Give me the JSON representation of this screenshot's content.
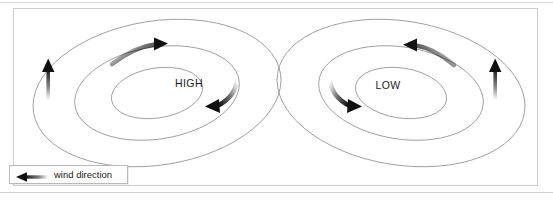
{
  "diagram": {
    "type": "meteorological-pressure-systems",
    "systems": [
      {
        "id": "high",
        "label": "HIGH",
        "rotation_sense": "clockwise",
        "label_x": 175,
        "label_y": 78,
        "center_x": 143,
        "center_y": 84,
        "tilt_deg": -9,
        "isobars": [
          {
            "rx": 125,
            "ry": 72
          },
          {
            "rx": 83,
            "ry": 46
          },
          {
            "rx": 46,
            "ry": 25
          }
        ],
        "curved_arrows": [
          {
            "name": "top-clockwise-arrow",
            "direction": "right"
          },
          {
            "name": "bottom-clockwise-arrow",
            "direction": "left"
          }
        ],
        "straight_arrow": {
          "name": "outflow-arrow-left",
          "direction": "up",
          "x": 47,
          "y_top": 62,
          "y_bottom": 99
        }
      },
      {
        "id": "low",
        "label": "LOW",
        "rotation_sense": "counter-clockwise",
        "label_x": 372,
        "label_y": 80,
        "center_x": 400,
        "center_y": 84,
        "tilt_deg": 9,
        "isobars": [
          {
            "rx": 125,
            "ry": 72
          },
          {
            "rx": 83,
            "ry": 46
          },
          {
            "rx": 46,
            "ry": 25
          }
        ],
        "curved_arrows": [
          {
            "name": "top-counterclockwise-arrow",
            "direction": "left"
          },
          {
            "name": "bottom-counterclockwise-arrow",
            "direction": "right"
          }
        ],
        "straight_arrow": {
          "name": "inflow-arrow-right",
          "direction": "up",
          "x": 494,
          "y_top": 62,
          "y_bottom": 99
        }
      }
    ],
    "colors": {
      "isobar_stroke": "#8f8f8f",
      "arrow_fill": "#111111",
      "label_text": "#1c1c1c",
      "panel_border": "#cdcdcd",
      "page_background": "#ffffff"
    }
  },
  "legend": {
    "label": "wind direction",
    "arrow_direction": "left",
    "arrow_style": "fading-tail"
  }
}
